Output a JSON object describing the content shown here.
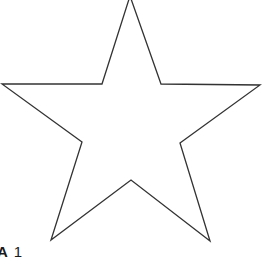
{
  "figure": {
    "shape": "five-pointed star outline",
    "stroke_color": "#333333",
    "fill_color": "#ffffff",
    "stroke_width": 1.3,
    "points": "130,-4 102,84 2,84 82,142 51,240 131,180 210,241 180,143 260,85 161,84"
  },
  "label": {
    "letter": "A",
    "number": "1"
  }
}
